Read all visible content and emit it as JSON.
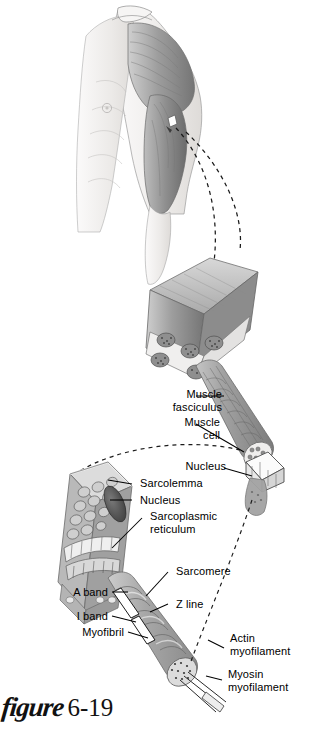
{
  "figure": {
    "caption_word": "figure",
    "caption_number": "6-19"
  },
  "labels": [
    {
      "id": "muscle-fasciculus",
      "text": "Muscle\nfasciculus",
      "align": "right"
    },
    {
      "id": "muscle-cell",
      "text": "Muscle\ncell",
      "align": "right"
    },
    {
      "id": "nucleus-upper",
      "text": "Nucleus",
      "align": "right"
    },
    {
      "id": "sarcolemma",
      "text": "Sarcolemma",
      "align": "left"
    },
    {
      "id": "nucleus-lower",
      "text": "Nucleus",
      "align": "left"
    },
    {
      "id": "sarcoplasmic-reticulum",
      "text": "Sarcoplasmic\nreticulum",
      "align": "left"
    },
    {
      "id": "sarcomere",
      "text": "Sarcomere",
      "align": "left"
    },
    {
      "id": "a-band",
      "text": "A band",
      "align": "right"
    },
    {
      "id": "z-line",
      "text": "Z line",
      "align": "left"
    },
    {
      "id": "i-band",
      "text": "I band",
      "align": "right"
    },
    {
      "id": "myofibril",
      "text": "Myofibril",
      "align": "right"
    },
    {
      "id": "actin-myofilament",
      "text": "Actin\nmyofilament",
      "align": "left"
    },
    {
      "id": "myosin-myofilament",
      "text": "Myosin\nmyofilament",
      "align": "left"
    }
  ],
  "colors": {
    "background": "#ffffff",
    "text": "#000000",
    "leader_line": "#000000",
    "muscle_mid": "#9a9a9a",
    "muscle_light": "#c9c9c9",
    "muscle_dark": "#6e6e6e",
    "skin": "#f2f0ee",
    "outline": "#5a5a5a"
  }
}
